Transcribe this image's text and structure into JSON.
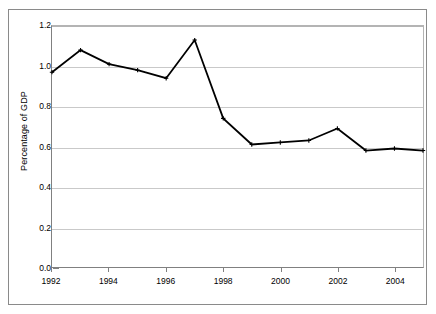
{
  "chart_data": {
    "type": "line",
    "title": "",
    "subtitle": "",
    "xlabel": "",
    "ylabel": "Percentage of GDP",
    "x": [
      1992,
      1993,
      1994,
      1995,
      1996,
      1997,
      1998,
      1999,
      2000,
      2001,
      2002,
      2003,
      2004,
      2005
    ],
    "values": [
      0.97,
      1.08,
      1.01,
      0.98,
      0.94,
      1.13,
      0.74,
      0.61,
      0.62,
      0.63,
      0.69,
      0.58,
      0.59,
      0.58
    ],
    "series": [
      {
        "name": "Percentage of GDP",
        "color": "#000000",
        "values": [
          0.97,
          1.08,
          1.01,
          0.98,
          0.94,
          1.13,
          0.74,
          0.61,
          0.62,
          0.63,
          0.69,
          0.58,
          0.59,
          0.58
        ]
      }
    ],
    "xlim": [
      1992,
      2005
    ],
    "ylim": [
      0.0,
      1.2
    ],
    "ytick_labels": [
      "0.0",
      "0.2",
      "0.4",
      "0.6",
      "0.8",
      "1.0",
      "1.2"
    ],
    "ytick_values": [
      0.0,
      0.2,
      0.4,
      0.6,
      0.8,
      1.0,
      1.2
    ],
    "xtick_labels": [
      "1992",
      "1994",
      "1996",
      "1998",
      "2000",
      "2002",
      "2004"
    ],
    "xtick_values": [
      1992,
      1994,
      1996,
      1998,
      2000,
      2002,
      2004
    ],
    "grid": "horizontal",
    "legend": "none",
    "marker": "cross",
    "line_width": 1.8,
    "annotations": []
  },
  "style": {
    "line_color": "#000000",
    "grid_color": "#c9c9c9",
    "axis_color": "#808080",
    "frame_color": "#8a8a8a",
    "background": "#ffffff",
    "text_color": "#000000"
  }
}
